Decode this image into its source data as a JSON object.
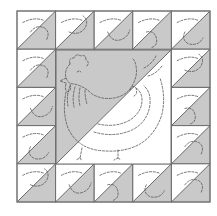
{
  "diagram": {
    "title": "",
    "type": "quilt-block",
    "colors": {
      "background": "#ffffff",
      "fabric_light": "#ffffff",
      "fabric_dark": "#c9c9c9",
      "seam_line": "#6a6a6a",
      "stitch_line": "#555555"
    },
    "frame": {
      "x": 17,
      "y": 11,
      "width": 193,
      "height": 191
    },
    "grid": {
      "columns": 5,
      "rows": 5
    },
    "border_units": {
      "count": 16,
      "orientation": "diagonal bottom-left to top-right; light top-left, dark bottom-right"
    },
    "center_unit": {
      "grid_span": {
        "col": 1,
        "row": 1,
        "cols": 3,
        "rows": 3
      },
      "orientation": "diagonal bottom-left to top-right; dark top-left, light bottom-right",
      "motif": "hen"
    }
  }
}
